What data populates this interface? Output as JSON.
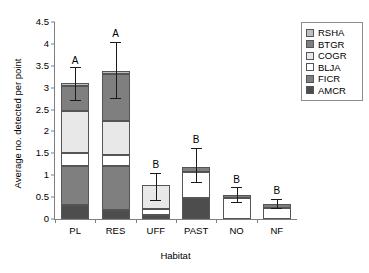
{
  "chart_data": {
    "type": "bar",
    "subtype": "stacked-bar-with-error-bars",
    "title": "",
    "xlabel": "Habitat",
    "ylabel": "Average no. detected per point",
    "ylim": [
      0,
      4.5
    ],
    "ytick_labels": [
      "0",
      "0.5",
      "1",
      "1.5",
      "2",
      "2.5",
      "3",
      "3.5",
      "4",
      "4.5"
    ],
    "ytick_values": [
      0,
      0.5,
      1,
      1.5,
      2,
      2.5,
      3,
      3.5,
      4,
      4.5
    ],
    "grid": false,
    "legend_position": "top-right",
    "categories": [
      "PL",
      "RES",
      "UFF",
      "PAST",
      "NO",
      "NF"
    ],
    "series": [
      {
        "name": "AMCR",
        "color": "#4d4d4d",
        "values": [
          0.33,
          0.2,
          0.08,
          0.47,
          0.0,
          0.0
        ]
      },
      {
        "name": "FICR",
        "color": "#7f7f7f",
        "values": [
          0.88,
          1.0,
          0.0,
          0.0,
          0.0,
          0.0
        ]
      },
      {
        "name": "BLJA",
        "color": "#ffffff",
        "values": [
          0.3,
          0.27,
          0.14,
          0.6,
          0.47,
          0.26
        ]
      },
      {
        "name": "COGR",
        "color": "#e8e8e8",
        "values": [
          0.95,
          0.77,
          0.56,
          0.0,
          0.0,
          0.0
        ]
      },
      {
        "name": "BTGR",
        "color": "#7f7f7f",
        "values": [
          0.58,
          1.08,
          0.0,
          0.11,
          0.08,
          0.08
        ]
      },
      {
        "name": "RSHA",
        "color": "#bfbfbf",
        "values": [
          0.07,
          0.07,
          0.0,
          0.0,
          0.0,
          0.0
        ]
      }
    ],
    "totals": [
      3.11,
      3.39,
      0.78,
      1.18,
      0.55,
      0.34
    ],
    "error_bars": [
      {
        "category": "PL",
        "low": 2.72,
        "high": 3.47
      },
      {
        "category": "RES",
        "low": 2.76,
        "high": 4.04
      },
      {
        "category": "UFF",
        "low": 0.44,
        "high": 1.06
      },
      {
        "category": "PAST",
        "low": 0.84,
        "high": 1.62
      },
      {
        "category": "NO",
        "low": 0.38,
        "high": 0.73
      },
      {
        "category": "NF",
        "low": 0.24,
        "high": 0.46
      }
    ],
    "significance_labels": [
      {
        "category": "PL",
        "label": "A",
        "y": 3.62
      },
      {
        "category": "RES",
        "label": "A",
        "y": 4.22
      },
      {
        "category": "UFF",
        "label": "B",
        "y": 1.23
      },
      {
        "category": "PAST",
        "label": "B",
        "y": 1.8
      },
      {
        "category": "NO",
        "label": "B",
        "y": 0.9
      },
      {
        "category": "NF",
        "label": "B",
        "y": 0.63
      }
    ],
    "legend_entries": [
      {
        "label": "RSHA",
        "color": "#bfbfbf"
      },
      {
        "label": "BTGR",
        "color": "#7f7f7f"
      },
      {
        "label": "COGR",
        "color": "#e8e8e8"
      },
      {
        "label": "BLJA",
        "color": "#ffffff"
      },
      {
        "label": "FICR",
        "color": "#7f7f7f"
      },
      {
        "label": "AMCR",
        "color": "#4d4d4d"
      }
    ]
  }
}
